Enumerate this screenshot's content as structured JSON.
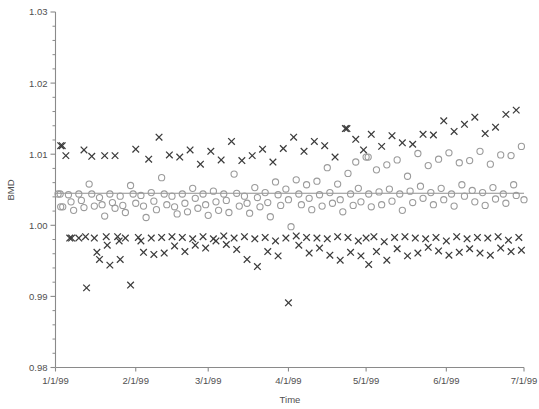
{
  "chart_data": {
    "type": "scatter",
    "title": "",
    "xlabel": "Time",
    "ylabel": "BMD",
    "ylim": [
      0.98,
      1.03
    ],
    "ytick_labels": [
      "0.98",
      "0.99",
      "1.00",
      "1.01",
      "1.02",
      "1.03"
    ],
    "ytick_values": [
      0.98,
      0.99,
      1.0,
      1.01,
      1.02,
      1.03
    ],
    "yminor_step": 0.002,
    "grid": false,
    "legend": "none",
    "xtick_labels": [
      "1/1/99",
      "2/1/99",
      "3/1/99",
      "4/1/99",
      "5/1/99",
      "6/1/99",
      "7/1/99"
    ],
    "xtick_values": [
      0,
      31,
      59,
      90,
      120,
      151,
      181
    ],
    "xlim": [
      0,
      181
    ],
    "reference_line": {
      "value": 1.0045,
      "label": ""
    },
    "series": [
      {
        "name": "cross-series",
        "marker": "x",
        "color": "#3b3b3b",
        "points": [
          [
            2,
            1.0112
          ],
          [
            2.6,
            1.0112
          ],
          [
            4,
            1.0098
          ],
          [
            5.5,
            0.9982
          ],
          [
            6.2,
            0.9982
          ],
          [
            9,
            0.9982
          ],
          [
            11,
            1.0106
          ],
          [
            11.6,
            0.9984
          ],
          [
            12,
            0.9912
          ],
          [
            14,
            1.0097
          ],
          [
            15,
            0.9982
          ],
          [
            16,
            0.9962
          ],
          [
            17,
            0.9952
          ],
          [
            19,
            1.0098
          ],
          [
            19.6,
            0.9984
          ],
          [
            20,
            0.9972
          ],
          [
            21,
            0.9944
          ],
          [
            23,
            1.0098
          ],
          [
            24,
            0.9984
          ],
          [
            24.6,
            0.9978
          ],
          [
            25,
            0.9952
          ],
          [
            27,
            0.9982
          ],
          [
            29,
            0.9916
          ],
          [
            31,
            1.0107
          ],
          [
            32,
            0.9983
          ],
          [
            33,
            0.9978
          ],
          [
            34,
            0.9962
          ],
          [
            36,
            1.0093
          ],
          [
            37,
            0.9982
          ],
          [
            38,
            0.9959
          ],
          [
            40,
            1.0124
          ],
          [
            41,
            0.9983
          ],
          [
            42,
            0.9961
          ],
          [
            44,
            1.0099
          ],
          [
            45,
            0.9984
          ],
          [
            46,
            0.9971
          ],
          [
            48,
            1.0096
          ],
          [
            49,
            0.9983
          ],
          [
            50,
            0.9963
          ],
          [
            52,
            1.0106
          ],
          [
            53,
            0.9981
          ],
          [
            54,
            0.9972
          ],
          [
            56,
            1.0086
          ],
          [
            57,
            0.9984
          ],
          [
            58,
            0.9968
          ],
          [
            60,
            1.0104
          ],
          [
            61,
            0.9981
          ],
          [
            62,
            0.9978
          ],
          [
            64,
            1.0092
          ],
          [
            65,
            0.9985
          ],
          [
            66,
            0.9973
          ],
          [
            68,
            1.0118
          ],
          [
            69,
            0.9982
          ],
          [
            70,
            0.9966
          ],
          [
            72,
            1.0091
          ],
          [
            73,
            0.9984
          ],
          [
            74,
            0.9952
          ],
          [
            76,
            1.0098
          ],
          [
            77,
            0.9981
          ],
          [
            78,
            0.9942
          ],
          [
            80,
            1.0107
          ],
          [
            81,
            0.9983
          ],
          [
            82,
            0.9963
          ],
          [
            84,
            1.0089
          ],
          [
            85,
            0.9978
          ],
          [
            86,
            0.9957
          ],
          [
            88,
            1.0108
          ],
          [
            89,
            0.9982
          ],
          [
            90,
            0.9891
          ],
          [
            92,
            1.0124
          ],
          [
            93,
            0.9985
          ],
          [
            94,
            0.9972
          ],
          [
            96,
            1.0104
          ],
          [
            97,
            0.9983
          ],
          [
            98,
            0.9961
          ],
          [
            100,
            1.0118
          ],
          [
            101,
            0.9982
          ],
          [
            102,
            0.9968
          ],
          [
            104,
            1.0112
          ],
          [
            105,
            0.9981
          ],
          [
            106,
            0.9958
          ],
          [
            108,
            1.0096
          ],
          [
            109,
            0.9984
          ],
          [
            110,
            0.9951
          ],
          [
            112,
            1.0136
          ],
          [
            112.6,
            1.0136
          ],
          [
            113,
            0.9983
          ],
          [
            114,
            0.9962
          ],
          [
            116,
            1.0121
          ],
          [
            117,
            0.9978
          ],
          [
            118,
            0.9957
          ],
          [
            119,
            1.0106
          ],
          [
            120,
            0.9982
          ],
          [
            121,
            0.9945
          ],
          [
            122,
            1.0128
          ],
          [
            123,
            0.9984
          ],
          [
            124,
            0.9963
          ],
          [
            126,
            1.0111
          ],
          [
            127,
            0.9977
          ],
          [
            128,
            0.9951
          ],
          [
            130,
            1.0126
          ],
          [
            131,
            0.9983
          ],
          [
            132,
            0.9967
          ],
          [
            134,
            1.0116
          ],
          [
            135,
            0.9984
          ],
          [
            136,
            0.9957
          ],
          [
            138,
            1.0114
          ],
          [
            139,
            0.9982
          ],
          [
            140,
            0.9961
          ],
          [
            142,
            1.0128
          ],
          [
            143,
            0.9981
          ],
          [
            144,
            0.9969
          ],
          [
            146,
            1.0127
          ],
          [
            147,
            0.9983
          ],
          [
            148,
            0.9964
          ],
          [
            150,
            1.0147
          ],
          [
            151,
            0.9978
          ],
          [
            152,
            0.9958
          ],
          [
            154,
            1.0132
          ],
          [
            155,
            0.9984
          ],
          [
            156,
            0.9962
          ],
          [
            158,
            1.0142
          ],
          [
            159,
            0.9981
          ],
          [
            160,
            0.9967
          ],
          [
            162,
            1.0152
          ],
          [
            163,
            0.9983
          ],
          [
            164,
            0.9961
          ],
          [
            166,
            1.0129
          ],
          [
            167,
            0.9982
          ],
          [
            168,
            0.9958
          ],
          [
            170,
            1.0138
          ],
          [
            171,
            0.9984
          ],
          [
            172,
            0.9968
          ],
          [
            174,
            1.0156
          ],
          [
            175,
            0.9979
          ],
          [
            176,
            0.9963
          ],
          [
            178,
            1.0162
          ],
          [
            179,
            0.9983
          ],
          [
            180,
            0.9965
          ]
        ]
      },
      {
        "name": "circle-series",
        "marker": "o",
        "color": "#9b9b9b",
        "points": [
          [
            1,
            1.0044
          ],
          [
            1.8,
            1.0044
          ],
          [
            2,
            1.0026
          ],
          [
            2.8,
            1.0026
          ],
          [
            5,
            1.0043
          ],
          [
            6,
            1.0033
          ],
          [
            7,
            1.0021
          ],
          [
            9,
            1.0044
          ],
          [
            10,
            1.0035
          ],
          [
            11,
            1.0025
          ],
          [
            13,
            1.0058
          ],
          [
            14,
            1.0044
          ],
          [
            15,
            1.0027
          ],
          [
            17,
            1.0039
          ],
          [
            18,
            1.0029
          ],
          [
            19,
            1.0013
          ],
          [
            21,
            1.0044
          ],
          [
            22,
            1.0032
          ],
          [
            23,
            1.0024
          ],
          [
            25,
            1.0041
          ],
          [
            26,
            1.0028
          ],
          [
            27,
            1.0018
          ],
          [
            29,
            1.0056
          ],
          [
            30,
            1.0044
          ],
          [
            31,
            1.0031
          ],
          [
            33,
            1.0042
          ],
          [
            34,
            1.0027
          ],
          [
            35,
            1.0011
          ],
          [
            37,
            1.0046
          ],
          [
            38,
            1.0034
          ],
          [
            39,
            1.0022
          ],
          [
            41,
            1.0067
          ],
          [
            42,
            1.0044
          ],
          [
            43,
            1.0029
          ],
          [
            45,
            1.0041
          ],
          [
            46,
            1.0026
          ],
          [
            47,
            1.0016
          ],
          [
            49,
            1.0044
          ],
          [
            50,
            1.0031
          ],
          [
            51,
            1.0019
          ],
          [
            53,
            1.0052
          ],
          [
            54,
            1.0038
          ],
          [
            55,
            1.0024
          ],
          [
            57,
            1.0044
          ],
          [
            58,
            1.0029
          ],
          [
            59,
            1.0014
          ],
          [
            61,
            1.0048
          ],
          [
            62,
            1.0033
          ],
          [
            63,
            1.0021
          ],
          [
            65,
            1.0044
          ],
          [
            66,
            1.0035
          ],
          [
            67,
            1.0018
          ],
          [
            69,
            1.0072
          ],
          [
            70,
            1.0045
          ],
          [
            71,
            1.0027
          ],
          [
            73,
            1.0041
          ],
          [
            74,
            1.0031
          ],
          [
            75,
            1.0017
          ],
          [
            77,
            1.0053
          ],
          [
            78,
            1.0039
          ],
          [
            79,
            1.0026
          ],
          [
            81,
            1.0046
          ],
          [
            82,
            1.0032
          ],
          [
            83,
            1.0012
          ],
          [
            85,
            1.0061
          ],
          [
            86,
            1.0043
          ],
          [
            87,
            1.0028
          ],
          [
            89,
            1.0051
          ],
          [
            90,
            1.0036
          ],
          [
            91,
            0.9998
          ],
          [
            93,
            1.0064
          ],
          [
            94,
            1.0044
          ],
          [
            95,
            1.0029
          ],
          [
            97,
            1.0057
          ],
          [
            98,
            1.0038
          ],
          [
            99,
            1.0022
          ],
          [
            101,
            1.0062
          ],
          [
            102,
            1.0043
          ],
          [
            103,
            1.0027
          ],
          [
            105,
            1.0081
          ],
          [
            106,
            1.0046
          ],
          [
            107,
            1.0031
          ],
          [
            109,
            1.0058
          ],
          [
            110,
            1.0036
          ],
          [
            111,
            1.0019
          ],
          [
            113,
            1.0073
          ],
          [
            114,
            1.0044
          ],
          [
            115,
            1.0028
          ],
          [
            116,
            1.0089
          ],
          [
            117,
            1.0052
          ],
          [
            118,
            1.0033
          ],
          [
            120,
            1.0096
          ],
          [
            120.8,
            1.0096
          ],
          [
            121,
            1.0044
          ],
          [
            122,
            1.0026
          ],
          [
            124,
            1.0078
          ],
          [
            125,
            1.0047
          ],
          [
            126,
            1.0029
          ],
          [
            128,
            1.0085
          ],
          [
            129,
            1.0051
          ],
          [
            130,
            1.0034
          ],
          [
            132,
            1.0092
          ],
          [
            133,
            1.0044
          ],
          [
            134,
            1.0021
          ],
          [
            136,
            1.0069
          ],
          [
            137,
            1.0048
          ],
          [
            138,
            1.0032
          ],
          [
            140,
            1.0101
          ],
          [
            141,
            1.0055
          ],
          [
            142,
            1.0038
          ],
          [
            144,
            1.0084
          ],
          [
            145,
            1.0046
          ],
          [
            146,
            1.0029
          ],
          [
            148,
            1.0093
          ],
          [
            149,
            1.0052
          ],
          [
            150,
            1.0036
          ],
          [
            152,
            1.0102
          ],
          [
            153,
            1.0044
          ],
          [
            154,
            1.0027
          ],
          [
            156,
            1.0088
          ],
          [
            157,
            1.0057
          ],
          [
            158,
            1.0041
          ],
          [
            160,
            1.0091
          ],
          [
            161,
            1.0049
          ],
          [
            162,
            1.0033
          ],
          [
            164,
            1.0104
          ],
          [
            165,
            1.0046
          ],
          [
            166,
            1.0028
          ],
          [
            168,
            1.0086
          ],
          [
            169,
            1.0053
          ],
          [
            170,
            1.0037
          ],
          [
            172,
            1.0099
          ],
          [
            173,
            1.0044
          ],
          [
            174,
            1.0031
          ],
          [
            176,
            1.0098
          ],
          [
            177,
            1.0057
          ],
          [
            178,
            1.0042
          ],
          [
            180,
            1.0111
          ],
          [
            181,
            1.0036
          ]
        ]
      }
    ]
  }
}
